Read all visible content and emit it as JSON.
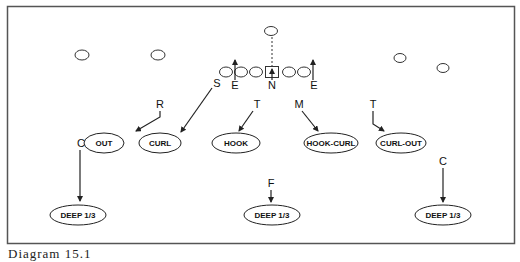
{
  "diagram": {
    "caption": "Diagram 15.1",
    "colors": {
      "line": "#222222",
      "frame": "#555555",
      "background": "#ffffff"
    },
    "offense": {
      "receivers": [
        {
          "id": "wr-left-1",
          "x": 82,
          "y": 55
        },
        {
          "id": "wr-left-2",
          "x": 158,
          "y": 55
        },
        {
          "id": "wr-right-1",
          "x": 400,
          "y": 58
        },
        {
          "id": "wr-right-2",
          "x": 443,
          "y": 68
        }
      ],
      "quarterback": {
        "x": 271,
        "y": 31
      },
      "line": [
        {
          "x": 226,
          "y": 72
        },
        {
          "x": 241,
          "y": 72
        },
        {
          "x": 256,
          "y": 72
        },
        {
          "x": 288,
          "y": 72
        },
        {
          "x": 303,
          "y": 72
        }
      ],
      "center_box": {
        "x": 272,
        "y": 72
      }
    },
    "defenders": [
      {
        "label": "E",
        "x": 235,
        "y": 88
      },
      {
        "label": "N",
        "x": 272,
        "y": 88
      },
      {
        "label": "E",
        "x": 314,
        "y": 88
      },
      {
        "label": "S",
        "x": 218,
        "y": 86
      },
      {
        "label": "R",
        "x": 160,
        "y": 107
      },
      {
        "label": "T",
        "x": 257,
        "y": 107
      },
      {
        "label": "M",
        "x": 299,
        "y": 107
      },
      {
        "label": "T",
        "x": 373,
        "y": 107
      },
      {
        "label": "C",
        "x": 82,
        "y": 146
      },
      {
        "label": "C",
        "x": 443,
        "y": 164
      },
      {
        "label": "F",
        "x": 271,
        "y": 186
      }
    ],
    "zones": [
      {
        "label": "OUT",
        "x": 104,
        "y": 143,
        "rx": 20
      },
      {
        "label": "CURL",
        "x": 160,
        "y": 143,
        "rx": 21
      },
      {
        "label": "HOOK",
        "x": 236,
        "y": 143,
        "rx": 24
      },
      {
        "label": "HOOK-CURL",
        "x": 331,
        "y": 143,
        "rx": 27
      },
      {
        "label": "CURL-OUT",
        "x": 401,
        "y": 143,
        "rx": 25
      },
      {
        "label": "DEEP 1/3",
        "x": 78,
        "y": 215,
        "rx": 28
      },
      {
        "label": "DEEP 1/3",
        "x": 272,
        "y": 215,
        "rx": 28
      },
      {
        "label": "DEEP 1/3",
        "x": 443,
        "y": 215,
        "rx": 28
      }
    ]
  }
}
